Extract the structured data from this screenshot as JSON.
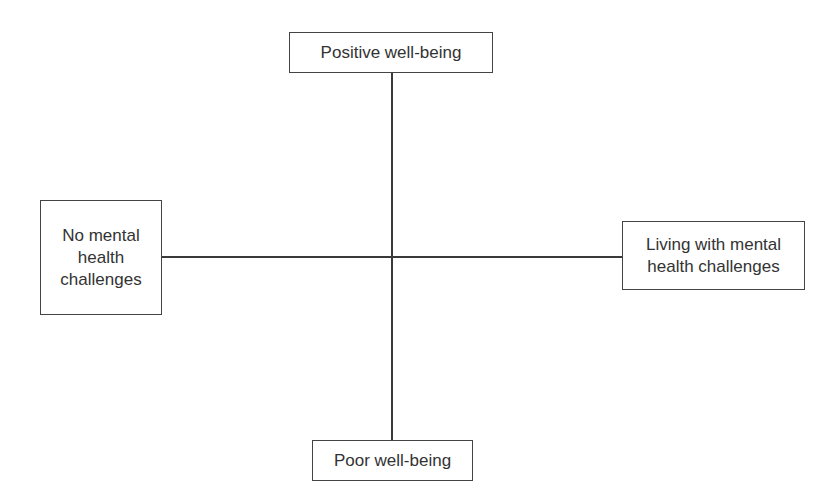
{
  "diagram": {
    "type": "quadrant-axes",
    "nodes": {
      "top": {
        "label": "Positive well-being"
      },
      "bottom": {
        "label": "Poor well-being"
      },
      "left": {
        "label": "No mental\nhealth\nchallenges"
      },
      "right": {
        "label": "Living with mental\nhealth challenges"
      }
    },
    "edges": [
      {
        "from": "top",
        "to": "bottom",
        "orientation": "vertical"
      },
      {
        "from": "left",
        "to": "right",
        "orientation": "horizontal"
      }
    ],
    "colors": {
      "line": "#3a3a3a",
      "border": "#444444",
      "text": "#333333",
      "background": "#ffffff"
    }
  }
}
